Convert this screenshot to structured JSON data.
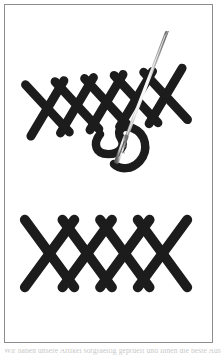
{
  "document": {
    "title": "Cross-stitch embroidery diagram",
    "background_color": "#ffffff"
  },
  "frame": {
    "border_color": "#8d8d8d",
    "fill_color": "#ffffff",
    "x": 4,
    "y": 4,
    "width": 209,
    "height": 339
  },
  "illustration": {
    "name": "cross-stitch-rows-with-needle",
    "stitch_color": "#1c1c1c",
    "needle_color": "#b9b9b9",
    "needle_shade_color": "#7a7a7a",
    "thread_color": "#1c1c1c",
    "description": "Two horizontal rows of cross stitches; the upper row is worked with a threaded needle passing through it diagonally",
    "upper_row": {
      "name": "upper-stitch-row",
      "stitch_count": 5,
      "tilt_degrees": -6,
      "y_center": 100
    },
    "lower_row": {
      "name": "lower-stitch-row",
      "stitch_count": 4,
      "tilt_degrees": 0,
      "y_center": 250
    },
    "needle": {
      "name": "sewing-needle",
      "tip_x": 168,
      "tip_y": 30,
      "eye_x": 119,
      "eye_y": 156,
      "angle_degrees": 21
    },
    "thread": {
      "name": "loose-thread",
      "shape": "s-curve"
    }
  },
  "caption": {
    "line": "Wir haben unsere Artikel sorgfaeltig geprueft und Ihnen die beste Auswahl"
  }
}
